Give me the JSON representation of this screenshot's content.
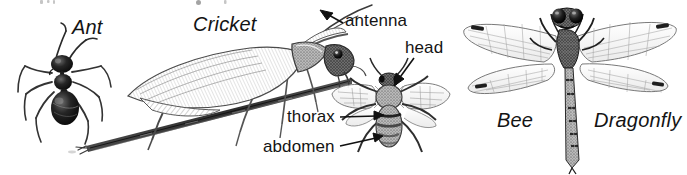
{
  "figure": {
    "background_color": "#ffffff",
    "ink_color": "#141414",
    "width": 687,
    "height": 175
  },
  "species_labels": [
    {
      "id": "ant",
      "text": "Ant",
      "style": "italic"
    },
    {
      "id": "cricket",
      "text": "Cricket",
      "style": "italic"
    },
    {
      "id": "bee",
      "text": "Bee",
      "style": "italic"
    },
    {
      "id": "dragonfly",
      "text": "Dragonfly",
      "style": "italic"
    }
  ],
  "part_labels": [
    {
      "id": "antenna",
      "text": "antenna",
      "points_to": "cricket-antenna",
      "leader": "arrow-up-left"
    },
    {
      "id": "head",
      "text": "head",
      "points_to": "bee-head",
      "leader": "arrow-down-left"
    },
    {
      "id": "thorax",
      "text": "thorax",
      "points_to": "bee-thorax",
      "leader": "arrow-right"
    },
    {
      "id": "abdomen",
      "text": "abdomen",
      "points_to": "bee-abdomen",
      "leader": "arrow-right"
    }
  ],
  "illustrations": [
    {
      "id": "ant",
      "name": "ant-illustration",
      "view": "dorsal"
    },
    {
      "id": "cricket",
      "name": "cricket-illustration",
      "view": "lateral",
      "perch": "twig"
    },
    {
      "id": "bee",
      "name": "bee-illustration",
      "view": "dorsal"
    },
    {
      "id": "dragonfly",
      "name": "dragonfly-illustration",
      "view": "dorsal"
    }
  ]
}
